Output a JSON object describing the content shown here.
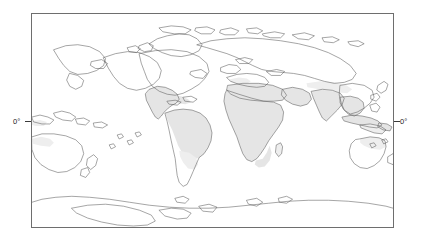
{
  "figure": {
    "type": "world-distribution-map",
    "projection": "equirectangular",
    "central_meridian_deg": 180,
    "background_color": "#ffffff",
    "frame_color": "#6e6e6e",
    "coastline_color": "#5c5c5c",
    "shade_color": "#e4e4e4"
  },
  "axes": {
    "left_label": "0°",
    "right_label": "0°",
    "latitude_ticks": [
      {
        "label": "0°",
        "value": 0,
        "side": "left"
      },
      {
        "label": "0°",
        "value": 0,
        "side": "right"
      }
    ],
    "lon_range": [
      0,
      360
    ],
    "lat_range": [
      -90,
      90
    ]
  },
  "legend": {
    "visible": false,
    "entries": []
  },
  "map_data": {
    "type": "choropleth-range",
    "shaded_regions": [
      "Mexico",
      "Central America",
      "Caribbean",
      "Northern South America",
      "Amazon Basin",
      "Brazil",
      "Sub-Saharan Africa",
      "North Africa",
      "Sahel",
      "Madagascar",
      "Arabian Peninsula",
      "Middle East",
      "Indian Subcontinent",
      "Southeast Asia",
      "Indonesia",
      "New Guinea",
      "Northern Australia",
      "Southern Iberia"
    ],
    "unshaded_regions": [
      "North America",
      "Greenland",
      "Northern Europe",
      "Siberia",
      "Southern South America",
      "Antarctica",
      "New Zealand",
      "Japan"
    ]
  }
}
